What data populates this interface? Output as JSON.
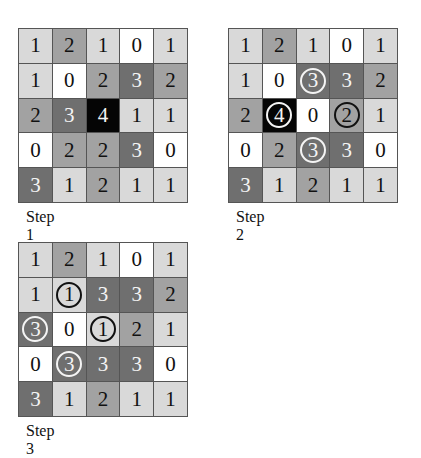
{
  "figure": {
    "cell_colors": {
      "0": "#ffffff",
      "1": "#d9d9d9",
      "2": "#a2a2a2",
      "3": "#6f6f6f",
      "4": "#050505"
    },
    "panels": [
      {
        "label": "Step 1",
        "grid": [
          [
            1,
            2,
            1,
            0,
            1
          ],
          [
            1,
            0,
            2,
            3,
            2
          ],
          [
            2,
            3,
            4,
            1,
            1
          ],
          [
            0,
            2,
            2,
            3,
            0
          ],
          [
            3,
            1,
            2,
            1,
            1
          ]
        ],
        "circled": []
      },
      {
        "label": "Step 2",
        "grid": [
          [
            1,
            2,
            1,
            0,
            1
          ],
          [
            1,
            0,
            3,
            3,
            2
          ],
          [
            2,
            4,
            0,
            2,
            1
          ],
          [
            0,
            2,
            3,
            3,
            0
          ],
          [
            3,
            1,
            2,
            1,
            1
          ]
        ],
        "circled": [
          [
            1,
            2
          ],
          [
            2,
            1
          ],
          [
            2,
            3
          ],
          [
            3,
            2
          ]
        ]
      },
      {
        "label": "Step 3",
        "grid": [
          [
            1,
            2,
            1,
            0,
            1
          ],
          [
            1,
            1,
            3,
            3,
            2
          ],
          [
            3,
            0,
            1,
            2,
            1
          ],
          [
            0,
            3,
            3,
            3,
            0
          ],
          [
            3,
            1,
            2,
            1,
            1
          ]
        ],
        "circled": [
          [
            1,
            1
          ],
          [
            2,
            0
          ],
          [
            2,
            2
          ],
          [
            3,
            1
          ]
        ]
      }
    ]
  }
}
